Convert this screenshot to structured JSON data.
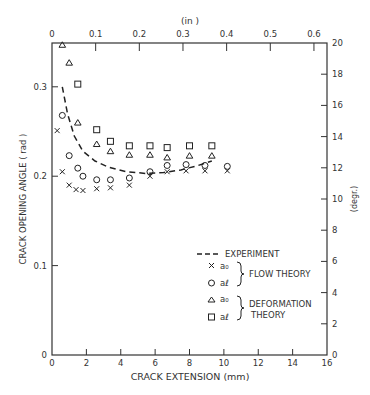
{
  "chart_data": {
    "type": "scatter",
    "title": "",
    "xlabel": "CRACK EXTENSION (mm)",
    "ylabel": "CRACK OPENING ANGLE (rad)",
    "x2label": "(in)",
    "y2label": "(degr.)",
    "xlim": [
      0,
      16
    ],
    "ylim": [
      0,
      0.349
    ],
    "x2lim": [
      0,
      0.63
    ],
    "y2lim": [
      0,
      20
    ],
    "x_ticks": [
      "0",
      "2",
      "4",
      "6",
      "8",
      "10",
      "12",
      "14",
      "16"
    ],
    "y_ticks": [
      "0",
      "0.1",
      "0.2",
      "0.3"
    ],
    "x2_ticks": [
      "0",
      "0.1",
      "0.2",
      "0.3",
      "0.4",
      "0.5",
      "0.6"
    ],
    "y2_ticks": [
      "0",
      "2",
      "4",
      "6",
      "8",
      "10",
      "12",
      "14",
      "16",
      "18",
      "20"
    ],
    "grid": false,
    "legend_position": "lower-right inside",
    "series": [
      {
        "name": "EXPERIMENT",
        "style": "dashed-line",
        "x": [
          0.6,
          0.9,
          1.3,
          1.8,
          2.5,
          3.3,
          4.3,
          5.5,
          6.5,
          7.5,
          8.5,
          9.3
        ],
        "y": [
          0.3,
          0.27,
          0.245,
          0.228,
          0.217,
          0.21,
          0.205,
          0.203,
          0.204,
          0.207,
          0.212,
          0.217
        ]
      },
      {
        "name": "a0 (Flow theory)",
        "marker": "x",
        "x": [
          0.3,
          0.6,
          1.0,
          1.4,
          1.8,
          2.6,
          3.4,
          4.5,
          5.7,
          6.7,
          7.8,
          8.9,
          10.2
        ],
        "y": [
          0.251,
          0.205,
          0.19,
          0.185,
          0.184,
          0.186,
          0.187,
          0.19,
          0.2,
          0.205,
          0.206,
          0.206,
          0.206
        ]
      },
      {
        "name": "al (Flow theory)",
        "marker": "circle",
        "x": [
          0.6,
          1.0,
          1.5,
          1.8,
          2.6,
          3.4,
          4.5,
          5.7,
          6.7,
          7.8,
          8.9,
          10.2
        ],
        "y": [
          0.268,
          0.223,
          0.209,
          0.2,
          0.196,
          0.196,
          0.198,
          0.205,
          0.212,
          0.213,
          0.212,
          0.211
        ]
      },
      {
        "name": "a0 (Deformation theory)",
        "marker": "triangle",
        "x": [
          0.6,
          1.0,
          1.5,
          2.6,
          3.4,
          4.5,
          5.7,
          6.7,
          8.0,
          9.3
        ],
        "y": [
          0.347,
          0.327,
          0.26,
          0.236,
          0.228,
          0.224,
          0.224,
          0.221,
          0.223,
          0.223
        ]
      },
      {
        "name": "al (Deformation theory)",
        "marker": "square",
        "x": [
          1.5,
          2.6,
          3.4,
          4.5,
          5.7,
          6.7,
          8.0,
          9.3
        ],
        "y": [
          0.303,
          0.252,
          0.239,
          0.234,
          0.234,
          0.232,
          0.234,
          0.234
        ]
      }
    ],
    "legend": [
      {
        "symbol": "dashed-line",
        "label": "EXPERIMENT"
      },
      {
        "symbol": "x",
        "label": "a0"
      },
      {
        "symbol": "circle",
        "label": "aℓ"
      },
      {
        "symbol": "triangle",
        "label": "a0"
      },
      {
        "symbol": "square",
        "label": "aℓ"
      }
    ],
    "legend_groups": [
      {
        "label": "FLOW THEORY",
        "members": [
          1,
          2
        ]
      },
      {
        "label": "DEFORMATION THEORY",
        "members": [
          3,
          4
        ]
      }
    ]
  },
  "labels": {
    "xlabel": "CRACK EXTENSION (mm)",
    "ylabel": "CRACK OPENING ANGLE ( rad )",
    "x2label": "(in )",
    "y2label": "(degr.)",
    "legend_experiment": "EXPERIMENT",
    "legend_a0": "a₀",
    "legend_al": "aℓ",
    "legend_flow": "FLOW THEORY",
    "legend_def1": "DEFORMATION",
    "legend_def2": "THEORY"
  }
}
